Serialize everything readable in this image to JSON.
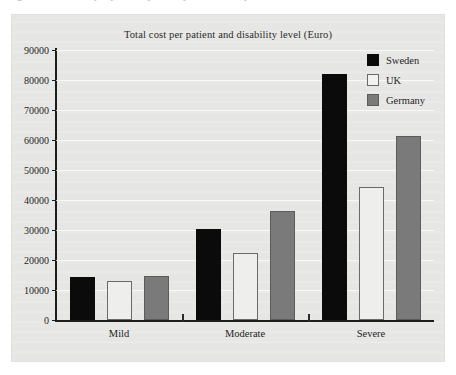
{
  "figure": {
    "top_caption_sliver": "Figure 2. Total cost per patient by country and disability level"
  },
  "chart_data": {
    "type": "bar",
    "title": "Total cost per patient and disability level (Euro)",
    "xlabel": "",
    "ylabel": "",
    "categories": [
      "Mild",
      "Moderate",
      "Severe"
    ],
    "series": [
      {
        "name": "Sweden",
        "color": "#0b0b0b",
        "values": [
          14300,
          30300,
          82000
        ]
      },
      {
        "name": "UK",
        "color": "#eeeeec",
        "values": [
          13000,
          22300,
          44500
        ]
      },
      {
        "name": "Germany",
        "color": "#7a7a7a",
        "values": [
          14700,
          36500,
          61500
        ]
      }
    ],
    "ylim": [
      0,
      90000
    ],
    "ytick_step": 10000,
    "yticks": [
      0,
      10000,
      20000,
      30000,
      40000,
      50000,
      60000,
      70000,
      80000,
      90000
    ],
    "ytick_labels": [
      "0",
      "10000",
      "20000",
      "30000",
      "40000",
      "50000",
      "60000",
      "70000",
      "80000",
      "90000"
    ],
    "grid": true,
    "grid_axis": "y",
    "legend_position": "top-right",
    "legend_entries": [
      "Sweden",
      "UK",
      "Germany"
    ],
    "background_color": "#e6e6e4",
    "axis_color": "#1c1c1c",
    "gridline_color": "#ffffff"
  }
}
